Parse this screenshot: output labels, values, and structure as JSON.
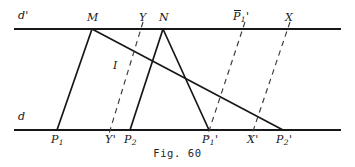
{
  "figure": {
    "caption": "Fig. 60",
    "ink_color": "#17171a",
    "background_color": "#ffffff",
    "width": 355,
    "height": 167
  },
  "lines": {
    "d_prime": {
      "name": "d'",
      "label": "d'",
      "y": 29,
      "x_start": 14,
      "x_end": 341
    },
    "d": {
      "name": "d",
      "label": "d",
      "y": 130,
      "x_start": 14,
      "x_end": 341
    }
  },
  "points": {
    "top": [
      {
        "id": "M",
        "label": "M",
        "text": "M",
        "x": 92,
        "y": 29,
        "label_x": 87,
        "label_y": 12
      },
      {
        "id": "Y",
        "label": "Y",
        "text": "Y",
        "x": 143,
        "y": 29,
        "label_x": 139,
        "label_y": 12
      },
      {
        "id": "N",
        "label": "N",
        "text": "N",
        "x": 163,
        "y": 29,
        "label_x": 159,
        "label_y": 12
      },
      {
        "id": "Pbar1p",
        "label": "P̄₁'",
        "text": "P",
        "sub": "1",
        "prime": "'",
        "overbar": true,
        "x": 243,
        "y": 29,
        "label_x": 233,
        "label_y": 11
      },
      {
        "id": "X",
        "label": "X",
        "text": "X",
        "x": 288,
        "y": 29,
        "label_x": 285,
        "label_y": 12
      }
    ],
    "bottom": [
      {
        "id": "P1",
        "label": "P₁",
        "text": "P",
        "sub": "1",
        "x": 57,
        "y": 130,
        "label_x": 51,
        "label_y": 134
      },
      {
        "id": "Yp",
        "label": "Y'",
        "text": "Y",
        "prime": "'",
        "x": 111,
        "y": 130,
        "label_x": 105,
        "label_y": 134
      },
      {
        "id": "P2",
        "label": "P₂",
        "text": "P",
        "sub": "2",
        "x": 130,
        "y": 130,
        "label_x": 124,
        "label_y": 134
      },
      {
        "id": "P1p",
        "label": "P₁'",
        "text": "P",
        "sub": "1",
        "prime": "'",
        "x": 209,
        "y": 130,
        "label_x": 202,
        "label_y": 134
      },
      {
        "id": "Xp",
        "label": "X'",
        "text": "X",
        "prime": "'",
        "x": 253,
        "y": 130,
        "label_x": 247,
        "label_y": 134
      },
      {
        "id": "P2p",
        "label": "P₂'",
        "text": "P",
        "sub": "2",
        "prime": "'",
        "x": 283,
        "y": 130,
        "label_x": 276,
        "label_y": 134
      }
    ],
    "interior": [
      {
        "id": "I",
        "label": "I",
        "text": "I",
        "label_x": 113,
        "label_y": 60
      }
    ]
  },
  "segments": {
    "solid": [
      {
        "id": "M-P1",
        "from": "M",
        "to": "P1",
        "x1": 92,
        "y1": 29,
        "x2": 57,
        "y2": 130
      },
      {
        "id": "M-P2p",
        "from": "M",
        "to": "P2p",
        "x1": 92,
        "y1": 29,
        "x2": 283,
        "y2": 130
      },
      {
        "id": "N-P2",
        "from": "N",
        "to": "P2",
        "x1": 163,
        "y1": 29,
        "x2": 130,
        "y2": 130
      },
      {
        "id": "N-P1p",
        "from": "N",
        "to": "P1p",
        "x1": 163,
        "y1": 29,
        "x2": 209,
        "y2": 130
      }
    ],
    "dashed": [
      {
        "id": "Y-Yp",
        "from": "Y",
        "to": "Yp",
        "x1": 143,
        "y1": 22,
        "x2": 108,
        "y2": 137
      },
      {
        "id": "Pbar1p-P1p",
        "from": "Pbar1p",
        "to": "P1p",
        "x1": 245,
        "y1": 22,
        "x2": 207,
        "y2": 137
      },
      {
        "id": "X-Xp",
        "from": "X",
        "to": "Xp",
        "x1": 290,
        "y1": 22,
        "x2": 251,
        "y2": 137
      }
    ]
  }
}
